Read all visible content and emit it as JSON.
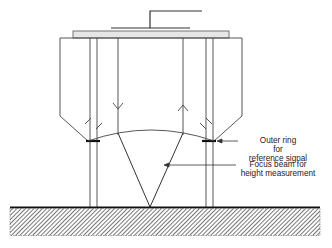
{
  "diagram": {
    "type": "sensor-head cross-section",
    "labels": {
      "outer_ring": [
        "Outer ring",
        "for",
        "reference signal"
      ],
      "focus_beam": [
        "Focus beam for",
        "height measurement"
      ]
    },
    "elements": [
      "mounting-bracket",
      "top-plate",
      "housing",
      "inner-tubes",
      "outgoing-beam-arrow",
      "return-beam-arrow",
      "lens-arc",
      "focus-cone",
      "ground-surface"
    ],
    "colors": {
      "line": "#333333",
      "plate_fill": "#e6e6e6",
      "hatch": "#555555"
    }
  }
}
